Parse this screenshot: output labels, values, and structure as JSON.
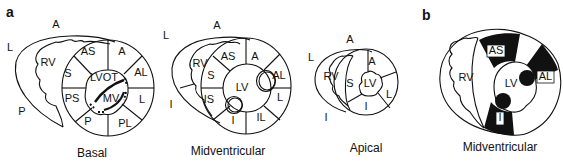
{
  "panels": {
    "a": "a",
    "b": "b"
  },
  "basal": {
    "caption": "Basal",
    "orientation": {
      "top": "A",
      "left": "L",
      "bottom_left": "P"
    },
    "labels": {
      "rv": "RV",
      "as": "AS",
      "a": "A",
      "al": "AL",
      "l": "L",
      "pl": "PL",
      "p": "P",
      "ps": "PS",
      "s": "S",
      "lvot": "LVOT",
      "mv": "MV"
    }
  },
  "midventricular": {
    "caption": "Midventricular",
    "orientation": {
      "top": "A",
      "left": "L",
      "bottom_left": "I"
    },
    "labels": {
      "rv": "RV",
      "as": "AS",
      "a": "A",
      "al": "AL",
      "l": "L",
      "il": "IL",
      "i": "I",
      "is": "IS",
      "s": "S",
      "lv": "LV"
    }
  },
  "apical": {
    "caption": "Apical",
    "orientation": {
      "top": "A",
      "left": "L",
      "bottom_left": "I"
    },
    "labels": {
      "rv": "RV",
      "s": "S",
      "a": "A",
      "l": "L",
      "i": "I",
      "lv": "LV"
    }
  },
  "midventricular_b": {
    "caption": "Midventricular",
    "labels": {
      "rv": "RV",
      "as": "AS",
      "al": "AL",
      "i": "I",
      "lv": "LV"
    },
    "highlight_color": "#111111"
  }
}
